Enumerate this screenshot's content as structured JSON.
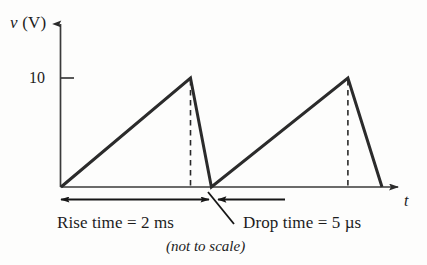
{
  "figure": {
    "background_color": "#fdfdfc",
    "line_color": "#2b2b2b",
    "axis_color": "#3a3a3a",
    "y_axis_label": "v (V)",
    "y_axis_label_var": "v",
    "y_axis_label_unit": " (V)",
    "x_axis_label": "t",
    "y_tick_label": "10",
    "rise_time_caption": "Rise time = 2 ms",
    "drop_time_caption": "Drop time = 5 µs",
    "note_caption": "(not to scale)"
  },
  "chart_data": {
    "type": "line",
    "title": "",
    "subtitle": "(not to scale)",
    "xlabel": "t",
    "ylabel": "v (V)",
    "grid": false,
    "legend": "none",
    "axis_arrows": true,
    "ylim": [
      0,
      12.5
    ],
    "xlim": [
      0,
      5.0
    ],
    "yticks": [
      10
    ],
    "ytick_labels": [
      "10"
    ],
    "xticks": [],
    "xtick_labels": [],
    "series": [
      {
        "name": "sawtooth voltage",
        "x": [
          0,
          1.86,
          2.16,
          4.12,
          4.61
        ],
        "y": [
          0,
          10,
          0,
          10,
          0
        ]
      }
    ],
    "annotations": [
      {
        "name": "rise-time-dimension",
        "text": "Rise time = 2 ms",
        "arrow": "double",
        "x_from": 0,
        "x_to": 2.16,
        "value": 2,
        "unit": "ms"
      },
      {
        "name": "drop-time-dimension",
        "text": "Drop time = 5 µs",
        "arrow": "single-left",
        "x_from": 2.16,
        "x_to": 1.36,
        "value": 5,
        "unit": "µs"
      },
      {
        "name": "not-to-scale-note",
        "text": "(not to scale)"
      }
    ],
    "dashed_guides": [
      {
        "name": "peak-guide-1",
        "x": 1.86,
        "y_from": 0,
        "y_to": 10
      },
      {
        "name": "peak-guide-2",
        "x": 4.12,
        "y_from": 0,
        "y_to": 10
      }
    ]
  }
}
